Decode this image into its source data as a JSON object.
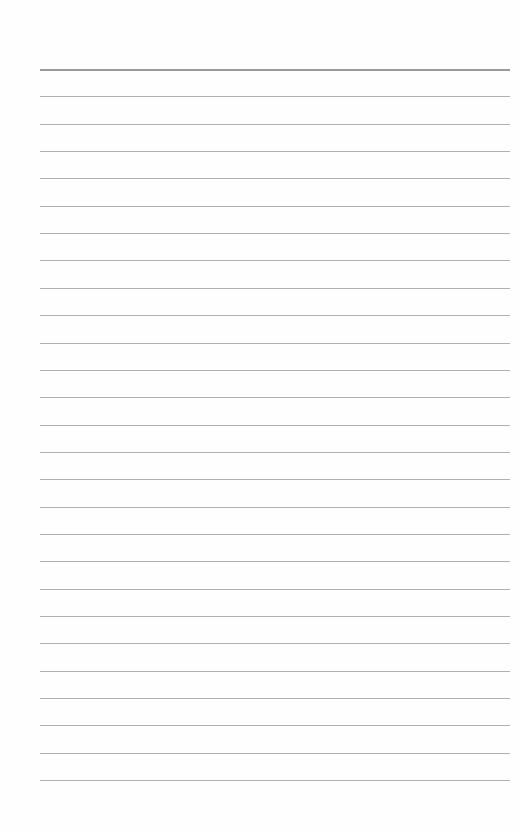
{
  "page": {
    "type": "lined-paper",
    "background": "#fefefe",
    "line_color": "#b0b0b0",
    "top_line_color": "#9a9a9a",
    "line_left": 40,
    "line_width": 470,
    "first_line_y": 69,
    "line_spacing": 27.35,
    "line_count": 27,
    "text": ""
  }
}
